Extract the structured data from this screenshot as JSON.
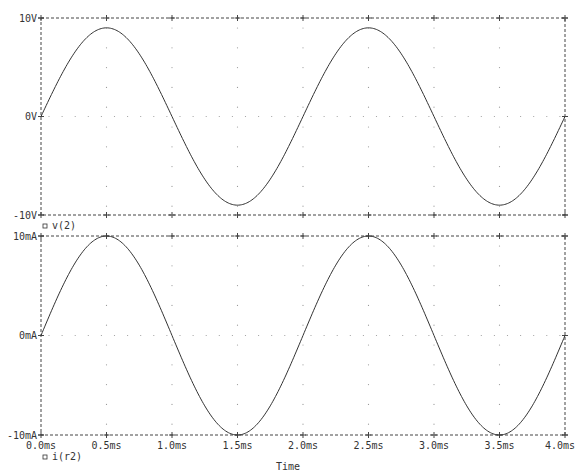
{
  "chart_data": [
    {
      "type": "line",
      "title": "",
      "xlabel": "Time",
      "ylabel": "",
      "legend": [
        {
          "marker": "square",
          "label": "v(2)"
        }
      ],
      "y_ticks": [
        "10V",
        "0V",
        "-10V"
      ],
      "ylim": [
        -10,
        10
      ],
      "y_unit": "V",
      "x_ticks": [
        "0.0ms",
        "0.5ms",
        "1.0ms",
        "1.5ms",
        "2.0ms",
        "2.5ms",
        "3.0ms",
        "3.5ms",
        "4.0ms"
      ],
      "xlim": [
        0,
        4.0
      ],
      "grid": "dotted",
      "series": [
        {
          "name": "v(2)",
          "function": "9*sin(2*pi*500*t)",
          "amplitude": 9,
          "frequency_hz": 500,
          "x": [
            0,
            0.5,
            1.0,
            1.5,
            2.0,
            2.5,
            3.0,
            3.5,
            4.0
          ],
          "values": [
            0,
            9,
            0,
            -9,
            0,
            9,
            0,
            -9,
            0
          ]
        }
      ]
    },
    {
      "type": "line",
      "title": "",
      "xlabel": "Time",
      "ylabel": "",
      "legend": [
        {
          "marker": "square",
          "label": "i(r2)"
        }
      ],
      "y_ticks": [
        "10mA",
        "0mA",
        "-10mA"
      ],
      "ylim": [
        -10,
        10
      ],
      "y_unit": "mA",
      "x_ticks": [
        "0.0ms",
        "0.5ms",
        "1.0ms",
        "1.5ms",
        "2.0ms",
        "2.5ms",
        "3.0ms",
        "3.5ms",
        "4.0ms"
      ],
      "xlim": [
        0,
        4.0
      ],
      "grid": "dotted",
      "series": [
        {
          "name": "i(r2)",
          "function": "10*sin(2*pi*500*t)",
          "amplitude": 10,
          "frequency_hz": 500,
          "x": [
            0,
            0.5,
            1.0,
            1.5,
            2.0,
            2.5,
            3.0,
            3.5,
            4.0
          ],
          "values": [
            0,
            10,
            0,
            -10,
            0,
            10,
            0,
            -10,
            0
          ]
        }
      ]
    }
  ],
  "labels": {
    "top_y": [
      "10V",
      "0V",
      "-10V"
    ],
    "bottom_y": [
      "10mA",
      "0mA",
      "-10mA"
    ],
    "x": [
      "0.0ms",
      "0.5ms",
      "1.0ms",
      "1.5ms",
      "2.0ms",
      "2.5ms",
      "3.0ms",
      "3.5ms",
      "4.0ms"
    ],
    "legend_top": "v(2)",
    "legend_bottom": "i(r2)",
    "xaxis_title": "Time"
  },
  "colors": {
    "trace": "#333333",
    "axis": "#444444",
    "grid": "#999999",
    "background": "#ffffff"
  }
}
